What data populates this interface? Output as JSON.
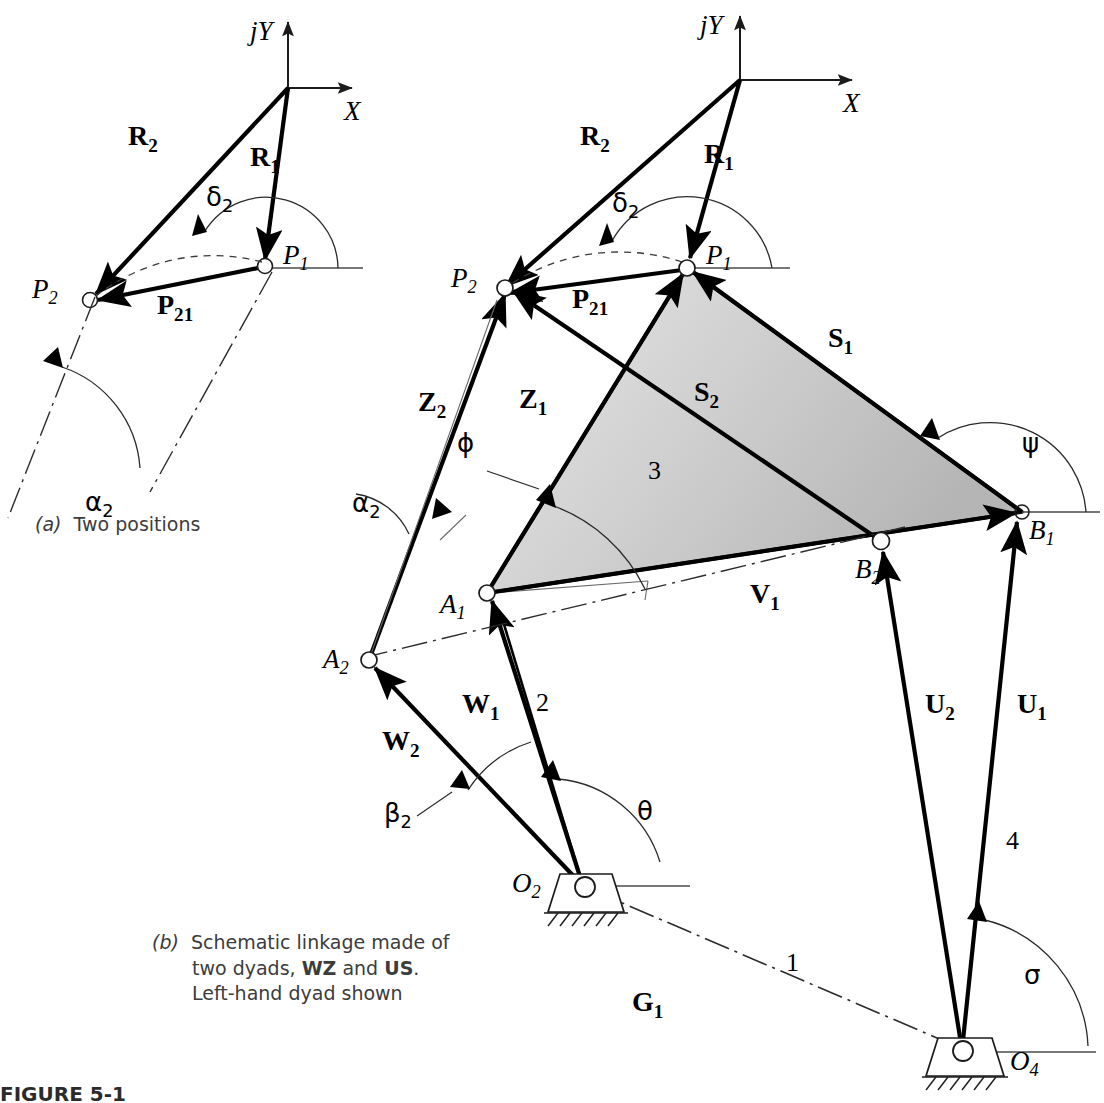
{
  "figure": {
    "number": "FIGURE 5-1",
    "captions": [
      {
        "key": "a",
        "marker": "(a)",
        "text": "Two positions"
      },
      {
        "key": "b",
        "marker": "(b)",
        "line1": "Schematic linkage made of",
        "line2_pre": "two dyads, ",
        "line2_b1": "WZ",
        "line2_mid": " and ",
        "line2_b2": "US",
        "line2_post": ".",
        "line3": "Left-hand dyad shown"
      }
    ]
  },
  "colors": {
    "ink": "#000000",
    "thin_line": "#3a3a3a",
    "coupler_fill_light": "#e2e2e2",
    "coupler_fill_dark": "#b9b9b9",
    "caption_text": "#3c3c3c"
  },
  "diagram_a": {
    "name": "Two positions",
    "axes": {
      "y_label": "jY",
      "x_label": "X"
    },
    "vectors": [
      {
        "name": "R2",
        "base": "R",
        "sub": "2"
      },
      {
        "name": "R1",
        "base": "R",
        "sub": "1"
      },
      {
        "name": "P21",
        "base": "P",
        "sub": "21"
      }
    ],
    "points": [
      {
        "name": "P1",
        "base": "P",
        "sub": "1"
      },
      {
        "name": "P2",
        "base": "P",
        "sub": "2"
      }
    ],
    "angles": [
      {
        "name": "delta2",
        "glyph": "δ",
        "sub": "2"
      },
      {
        "name": "alpha2",
        "glyph": "α",
        "sub": "2"
      }
    ]
  },
  "diagram_b": {
    "name": "Schematic linkage made of two dyads, WZ and US. Left-hand dyad shown",
    "axes": {
      "y_label": "jY",
      "x_label": "X"
    },
    "vectors": [
      {
        "name": "R2",
        "base": "R",
        "sub": "2"
      },
      {
        "name": "R1",
        "base": "R",
        "sub": "1"
      },
      {
        "name": "P21",
        "base": "P",
        "sub": "21"
      },
      {
        "name": "Z1",
        "base": "Z",
        "sub": "1"
      },
      {
        "name": "Z2",
        "base": "Z",
        "sub": "2"
      },
      {
        "name": "S1",
        "base": "S",
        "sub": "1"
      },
      {
        "name": "S2",
        "base": "S",
        "sub": "2"
      },
      {
        "name": "V1",
        "base": "V",
        "sub": "1"
      },
      {
        "name": "W1",
        "base": "W",
        "sub": "1"
      },
      {
        "name": "W2",
        "base": "W",
        "sub": "2"
      },
      {
        "name": "U1",
        "base": "U",
        "sub": "1"
      },
      {
        "name": "U2",
        "base": "U",
        "sub": "2"
      },
      {
        "name": "G1",
        "base": "G",
        "sub": "1"
      }
    ],
    "points": [
      {
        "name": "P1",
        "base": "P",
        "sub": "1"
      },
      {
        "name": "P2",
        "base": "P",
        "sub": "2"
      },
      {
        "name": "A1",
        "base": "A",
        "sub": "1"
      },
      {
        "name": "A2",
        "base": "A",
        "sub": "2"
      },
      {
        "name": "B1",
        "base": "B",
        "sub": "1"
      },
      {
        "name": "B2",
        "base": "B",
        "sub": "2"
      },
      {
        "name": "O2",
        "base": "O",
        "sub": "2"
      },
      {
        "name": "O4",
        "base": "O",
        "sub": "4"
      }
    ],
    "angles": [
      {
        "name": "delta2",
        "glyph": "δ",
        "sub": "2"
      },
      {
        "name": "alpha2",
        "glyph": "α",
        "sub": "2"
      },
      {
        "name": "phi",
        "glyph": "ϕ",
        "sub": ""
      },
      {
        "name": "psi",
        "glyph": "ψ",
        "sub": ""
      },
      {
        "name": "beta2",
        "glyph": "β",
        "sub": "2"
      },
      {
        "name": "theta",
        "glyph": "θ",
        "sub": ""
      },
      {
        "name": "sigma",
        "glyph": "σ",
        "sub": ""
      }
    ],
    "link_numbers": [
      {
        "name": "link-2",
        "value": "2"
      },
      {
        "name": "link-3",
        "value": "3"
      },
      {
        "name": "link-4",
        "value": "4"
      },
      {
        "name": "link-1",
        "value": "1"
      }
    ]
  }
}
